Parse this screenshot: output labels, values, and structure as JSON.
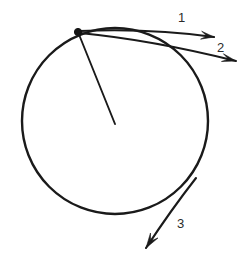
{
  "figure": {
    "background_color": "#ffffff",
    "ink_color": "#1a1a1a",
    "label_color": "#2b2b2b",
    "width": 252,
    "height": 261
  },
  "circle": {
    "name": "circular-path",
    "center_x": 115,
    "center_y": 121,
    "radius": 93,
    "stroke_width": 2.4
  },
  "point": {
    "name": "point-on-circle",
    "x": 78,
    "y": 32,
    "dot_radius": 3.6
  },
  "radius": {
    "name": "radius-segment",
    "from_x": 78,
    "from_y": 32,
    "to_x": 115,
    "to_y": 124
  },
  "vectors": [
    {
      "id": "vector-1",
      "label": "1",
      "label_x": 178,
      "label_y": 22,
      "start_x": 80,
      "start_y": 31,
      "end_x": 214,
      "end_y": 37,
      "curve_cx": 150,
      "curve_cy": 28,
      "head_angle_deg": 14,
      "head_length": 13,
      "head_width": 8
    },
    {
      "id": "vector-2",
      "label": "2",
      "label_x": 217,
      "label_y": 52,
      "start_x": 80,
      "start_y": 33,
      "end_x": 236,
      "end_y": 61,
      "curve_cx": 152,
      "curve_cy": 40,
      "head_angle_deg": 20,
      "head_length": 14,
      "head_width": 8
    },
    {
      "id": "vector-3",
      "label": "3",
      "label_x": 177,
      "label_y": 228,
      "start_x": 196,
      "start_y": 178,
      "end_x": 146,
      "end_y": 248,
      "curve_cx": 171,
      "curve_cy": 210,
      "head_angle_deg": 125,
      "head_length": 15,
      "head_width": 9
    }
  ]
}
